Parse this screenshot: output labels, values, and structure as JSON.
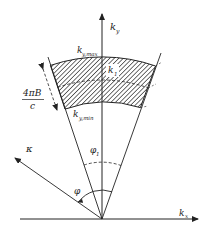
{
  "diagram": {
    "labels": {
      "ky_axis": "k",
      "ky_axis_sub": "y",
      "kx_axis": "k",
      "kx_axis_sub": "x",
      "ky_max": "k",
      "ky_max_sub": "y,max",
      "ky_min": "k",
      "ky_min_sub": "y,min",
      "k1": "k",
      "k1_sub": "1",
      "width_num": "4πB",
      "width_den": "c",
      "kappa": "κ",
      "phi": "φ",
      "phi1": "φ",
      "phi1_sub": "1"
    },
    "colors": {
      "line": "#222222",
      "hatch": "#333333",
      "background": "#ffffff"
    }
  }
}
